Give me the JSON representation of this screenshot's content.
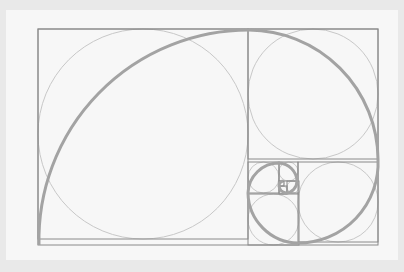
{
  "diagram": {
    "title": "",
    "type": "golden-spiral",
    "colors": {
      "background": "#e9e9e9",
      "panel": "#f7f7f7",
      "squares": "#8a8a8a",
      "circles": "#c8c8c8",
      "spiral": "#a3a3a3"
    },
    "outer_rect": {
      "x": 38,
      "y": 29,
      "w": 340,
      "h": 216
    },
    "squares": [
      {
        "x": 38,
        "y": 29,
        "s": 210
      },
      {
        "x": 248,
        "y": 29,
        "s": 130
      },
      {
        "x": 298,
        "y": 162,
        "s": 80
      },
      {
        "x": 248,
        "y": 194,
        "s": 51
      },
      {
        "x": 248,
        "y": 162,
        "s": 31
      },
      {
        "x": 279,
        "y": 162,
        "s": 19
      },
      {
        "x": 287,
        "y": 181,
        "s": 12
      },
      {
        "x": 279,
        "y": 186,
        "s": 8
      },
      {
        "x": 279,
        "y": 181,
        "s": 5
      }
    ]
  }
}
